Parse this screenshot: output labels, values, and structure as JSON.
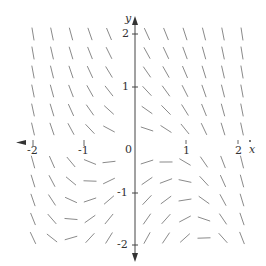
{
  "diagram": {
    "type": "slope-field",
    "equation_estimate": "dy/dx = -x^2 - y",
    "axes": {
      "x_label": "x",
      "y_label": "y",
      "x_ticks": [
        "-2",
        "-1",
        "0",
        "1",
        "2"
      ],
      "y_ticks": [
        "2",
        "1",
        "-1",
        "-2"
      ]
    },
    "origin_px": [
      135,
      143
    ],
    "unit_px": 51,
    "grid": {
      "columns_px": [
        33,
        52,
        71,
        90,
        109,
        147,
        166,
        185,
        204,
        223,
        242
      ],
      "rows_px": [
        34,
        53,
        72,
        91,
        110,
        129,
        162,
        181,
        200,
        219,
        238
      ]
    },
    "colors": {
      "segment": "#8a8a8a",
      "axis": "#444444",
      "text": "#333333"
    }
  }
}
